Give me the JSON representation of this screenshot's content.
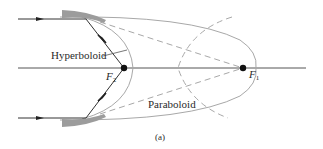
{
  "figure": {
    "caption": "(a)",
    "labels": {
      "hyperboloid": "Hyperboloid",
      "paraboloid": "Paraboloid",
      "focus_2": "F",
      "focus_2_sub": "2",
      "focus_1": "F",
      "focus_1_sub": "1"
    },
    "colors": {
      "axis": "#555555",
      "curve": "#a8a8a8",
      "dashed": "#a8a8a8",
      "ray": "#333333",
      "mirror": "#9c9c9c",
      "text": "#2a2a2a"
    },
    "elements": [
      "optical axis",
      "upper mirror segment",
      "lower mirror segment",
      "incoming ray upper",
      "incoming ray lower",
      "reflected ray upper to F2",
      "reflected ray lower to F2",
      "hyperboloid curve",
      "paraboloid curve",
      "dashed lines to F1",
      "dashed hyperbola branch"
    ]
  }
}
